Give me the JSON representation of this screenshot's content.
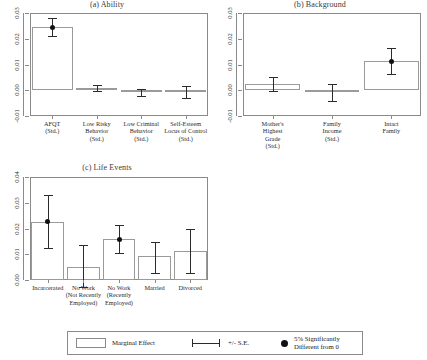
{
  "figure": {
    "width": 427,
    "height": 360
  },
  "legend": {
    "marginal_effect_label": "Marginal Effect",
    "se_label": "+/- S.E.",
    "significant_label": "5% Significantly\nDifferent from 0",
    "swatch_name": "bar-swatch",
    "errorbar_name": "errorbar-swatch",
    "dot_name": "significance-dot-swatch"
  },
  "chart_data": [
    {
      "type": "bar",
      "panel": "a",
      "title": "(a) Ability",
      "xlabel": "",
      "ylabel": "",
      "ylim": [
        -0.01,
        0.03
      ],
      "yticks": [
        -0.01,
        0.0,
        0.01,
        0.02,
        0.03
      ],
      "ytick_labels": [
        "-0.01",
        "0.00",
        "0.01",
        "0.02",
        "0.03"
      ],
      "grid": false,
      "categories": [
        "AFQT\n(Std.)",
        "Low Risky\nBehavior\n(Std.)",
        "Low Criminal\nBehavior\n(Std.)",
        "Self-Esteem\nLocus of Control\n(Std.)"
      ],
      "values": [
        0.0245,
        0.0009,
        -0.0008,
        -0.0008
      ],
      "se_low": [
        0.021,
        -0.0003,
        -0.0022,
        -0.0031
      ],
      "se_high": [
        0.0281,
        0.0021,
        0.0006,
        0.0016
      ],
      "significant": [
        true,
        false,
        false,
        false
      ]
    },
    {
      "type": "bar",
      "panel": "b",
      "title": "(b) Background",
      "xlabel": "",
      "ylabel": "",
      "ylim": [
        -0.01,
        0.03
      ],
      "yticks": [
        -0.01,
        0.0,
        0.01,
        0.02,
        0.03
      ],
      "ytick_labels": [
        "-0.01",
        "0.00",
        "0.01",
        "0.02",
        "0.03"
      ],
      "grid": false,
      "categories": [
        "Mother's\nHighest\nGrade\n(Std.)",
        "Family\nIncome\n(Std.)",
        "Intact\nFamily"
      ],
      "values": [
        0.0023,
        -0.0007,
        0.0113
      ],
      "se_low": [
        -0.0004,
        -0.004,
        0.0063
      ],
      "se_high": [
        0.0052,
        0.0026,
        0.0165
      ],
      "significant": [
        false,
        false,
        true
      ]
    },
    {
      "type": "bar",
      "panel": "c",
      "title": "(c) Life Events",
      "xlabel": "",
      "ylabel": "",
      "ylim": [
        0.0,
        0.04
      ],
      "yticks": [
        0.0,
        0.01,
        0.02,
        0.03,
        0.04
      ],
      "ytick_labels": [
        "0.00",
        "0.01",
        "0.02",
        "0.03",
        "0.04"
      ],
      "grid": false,
      "categories": [
        "Incarcerated",
        "No Work\n(Not Recently\nEmployed)",
        "No Work\n(Recently\nEmployed)",
        "Married",
        "Divorced"
      ],
      "values": [
        0.0226,
        0.005,
        0.0158,
        0.0092,
        0.0111
      ],
      "se_low": [
        0.0124,
        -0.0029,
        0.0103,
        0.0027,
        0.0029
      ],
      "se_high": [
        0.033,
        0.0136,
        0.0215,
        0.0148,
        0.0199
      ],
      "significant": [
        true,
        false,
        true,
        false,
        false
      ]
    }
  ]
}
